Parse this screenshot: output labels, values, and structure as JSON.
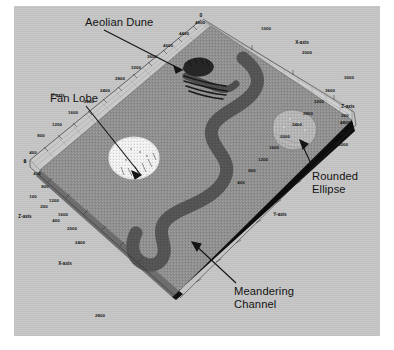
{
  "figure": {
    "type": "3d-geological-reservoir-model",
    "background_color": "#ffffff",
    "panel_color": "#c6c6c6",
    "surface_color": "#8f8f8f",
    "channel_color": "#5e5e5e",
    "fan_color": "#f2f2f2",
    "dune_color": "#2a2a2a",
    "ellipse_color": "#b4b4b4",
    "edge_color": "#111111"
  },
  "annotations": [
    {
      "id": "aeolian-dune",
      "label": "Aeolian Dune"
    },
    {
      "id": "fan-lobe",
      "label": "Fan Lobe"
    },
    {
      "id": "rounded-ellipse",
      "label": "Rounded\nEllipse"
    },
    {
      "id": "meandering-channel",
      "label": "Meandering\nChannel"
    }
  ],
  "axes": {
    "origin_label": "0",
    "top_origin_label": "0",
    "names": {
      "x": "X-axis",
      "y": "Y-axis",
      "z": "Z-axis"
    },
    "y_left": {
      "name": "Y-axis",
      "ticks": [
        "4800",
        "4400",
        "4000",
        "3600",
        "3200",
        "2800",
        "2400",
        "2000",
        "1600",
        "1200",
        "800",
        "400",
        "0"
      ]
    },
    "x_left": {
      "name": "X-axis",
      "ticks": [
        "400",
        "800",
        "1200",
        "1600",
        "2000",
        "2400",
        "2800"
      ]
    },
    "z_left": {
      "name": "Z-axis",
      "ticks": [
        "100",
        "200",
        "400"
      ]
    },
    "x_top": {
      "name": "X-axis",
      "ticks": [
        "1000",
        "2000",
        "3000"
      ]
    },
    "z_right": {
      "name": "Z-axis",
      "ticks": [
        "200",
        "4800",
        "4400",
        "4000"
      ]
    },
    "y_right": {
      "name": "Y-axis",
      "ticks": [
        "3600",
        "3200",
        "2800",
        "2400",
        "2000",
        "1600",
        "1200",
        "800",
        "400"
      ]
    }
  },
  "tick_positions": {
    "y_left": [
      [
        200,
        22
      ],
      [
        184,
        33
      ],
      [
        168,
        45
      ],
      [
        152,
        56
      ],
      [
        136,
        67
      ],
      [
        120,
        78
      ],
      [
        105,
        90
      ],
      [
        89,
        101
      ],
      [
        73,
        112
      ],
      [
        57,
        124
      ],
      [
        41,
        135
      ],
      [
        33,
        152
      ],
      [
        25,
        161
      ]
    ],
    "x_left": [
      [
        37,
        173
      ],
      [
        45,
        186
      ],
      [
        54,
        200
      ],
      [
        63,
        214
      ],
      [
        72,
        228
      ],
      [
        80,
        242
      ],
      [
        100,
        315
      ]
    ],
    "z_left": [
      [
        33,
        196
      ],
      [
        44,
        206
      ],
      [
        56,
        220
      ]
    ],
    "x_top": [
      [
        266,
        28
      ],
      [
        307,
        52
      ],
      [
        349,
        77
      ]
    ],
    "z_right": [
      [
        345,
        115
      ],
      [
        345,
        122
      ],
      [
        344,
        133
      ],
      [
        343,
        144
      ]
    ],
    "y_right": [
      [
        330,
        90
      ],
      [
        319,
        101
      ],
      [
        308,
        113
      ],
      [
        297,
        124
      ],
      [
        285,
        136
      ],
      [
        274,
        147
      ],
      [
        263,
        159
      ],
      [
        252,
        170
      ],
      [
        241,
        182
      ]
    ]
  },
  "axis_name_positions": {
    "y_left": [
      58,
      95
    ],
    "x_left": [
      65,
      263
    ],
    "z_left": [
      25,
      216
    ],
    "x_top": [
      302,
      42
    ],
    "z_right": [
      348,
      106
    ],
    "y_right": [
      280,
      214
    ]
  }
}
